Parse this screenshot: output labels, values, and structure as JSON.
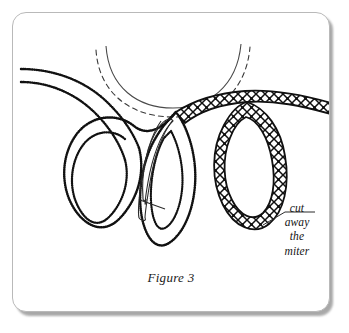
{
  "figure": {
    "caption": "Figure 3",
    "annotation": {
      "lines": [
        "cut",
        "away",
        "the",
        "miter"
      ],
      "line1": "cut",
      "line2": "away",
      "line3": "the",
      "line4": "miter"
    },
    "colors": {
      "ink": "#111111",
      "frame": "#b9b9b9",
      "shadow": "#9a9a9a",
      "paper": "#ffffff",
      "thin_line": "#3a3a3a"
    },
    "elements": {
      "neckline_solid_arc": "neckline curve",
      "neckline_dashed_arc": "seam allowance dashed curve",
      "left_loop_outer": "stippled outer loop",
      "left_loop_inner": "stippled inner loop",
      "middle_loop_thin": "thin outlined overlapping loop",
      "middle_loop_stippled": "stippled middle loop",
      "right_loop_hatched": "crosshatched ribbon loop",
      "ribbon_tail_left": "stippled ribbon tail to left edge",
      "ribbon_tail_right": "crosshatched ribbon tail to right edge",
      "leader_line": "pointer line to annotation"
    }
  }
}
